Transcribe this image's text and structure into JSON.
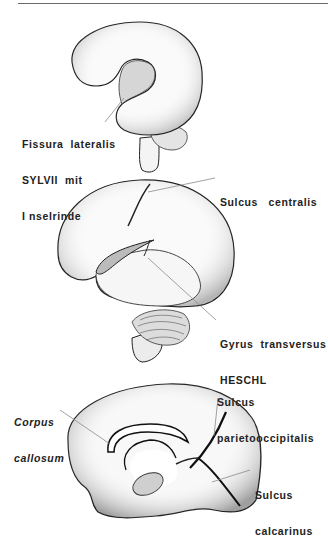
{
  "page": {
    "running_head": "Die Lage der Hörrinde im Großhirn"
  },
  "figures": [
    {
      "id": "brain-lateral-fetal",
      "labels": [
        {
          "text": [
            "Fissura  lateralis",
            "SYLVII  mit",
            "I nselrinde"
          ],
          "style": "bold"
        }
      ]
    },
    {
      "id": "brain-lateral-adult",
      "labels": [
        {
          "text": [
            "Sulcus   centralis"
          ],
          "style": "bold"
        },
        {
          "text": [
            "Gyrus  transversus",
            "HESCHL"
          ],
          "style": "bold"
        }
      ]
    },
    {
      "id": "brain-medial",
      "labels": [
        {
          "text": [
            "Corpus",
            "callosum"
          ],
          "style": "bold-italic"
        },
        {
          "text": [
            "Sulcus",
            "parietooccipitalis"
          ],
          "style": "bold"
        },
        {
          "text": [
            "Sulcus",
            "calcarinus"
          ],
          "style": "bold"
        }
      ]
    }
  ],
  "colors": {
    "ink": "#222222",
    "shade": "#bdbdbd",
    "leader": "#8a8a8a",
    "paper": "#ffffff"
  }
}
